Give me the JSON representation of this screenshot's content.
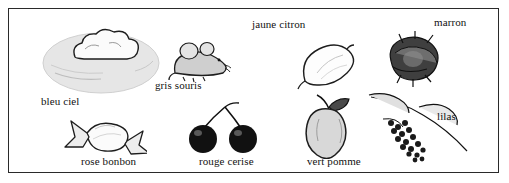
{
  "figure": {
    "title": "",
    "border_color": "#2a2a2a",
    "background": "#ffffff",
    "text_color": "#111111"
  },
  "items": [
    {
      "id": "cloud",
      "icon_name": "cloud-illustration",
      "label": "bleu ciel",
      "label_x": 32,
      "label_y": 88,
      "art_x": 40,
      "art_y": 20,
      "art_w": 120,
      "art_h": 70
    },
    {
      "id": "mouse",
      "icon_name": "mouse-illustration",
      "label": "gris souris",
      "label_x": 148,
      "label_y": 75,
      "art_x": 160,
      "art_y": 30,
      "art_w": 70,
      "art_h": 45
    },
    {
      "id": "lemon",
      "icon_name": "lemon-illustration",
      "label": "jaune citron",
      "label_x": 244,
      "label_y": 16,
      "art_x": 290,
      "art_y": 30,
      "art_w": 60,
      "art_h": 50
    },
    {
      "id": "chestnut",
      "icon_name": "chestnut-illustration",
      "label": "marron",
      "label_x": 426,
      "label_y": 13,
      "art_x": 375,
      "art_y": 25,
      "art_w": 60,
      "art_h": 50
    },
    {
      "id": "candy",
      "icon_name": "candy-illustration",
      "label": "rose bonbon",
      "label_x": 72,
      "label_y": 152,
      "art_x": 55,
      "art_y": 105,
      "art_w": 80,
      "art_h": 45
    },
    {
      "id": "cherries",
      "icon_name": "cherries-illustration",
      "label": "rouge cerise",
      "label_x": 192,
      "label_y": 152,
      "art_x": 178,
      "art_y": 96,
      "art_w": 75,
      "art_h": 55
    },
    {
      "id": "apple",
      "icon_name": "apple-illustration",
      "label": "vert pomme",
      "label_x": 299,
      "label_y": 152,
      "art_x": 290,
      "art_y": 90,
      "art_w": 70,
      "art_h": 60
    },
    {
      "id": "lilac",
      "icon_name": "lilac-branch-illustration",
      "label": "lilas",
      "label_x": 430,
      "label_y": 107,
      "art_x": 355,
      "art_y": 85,
      "art_w": 110,
      "art_h": 70
    }
  ]
}
